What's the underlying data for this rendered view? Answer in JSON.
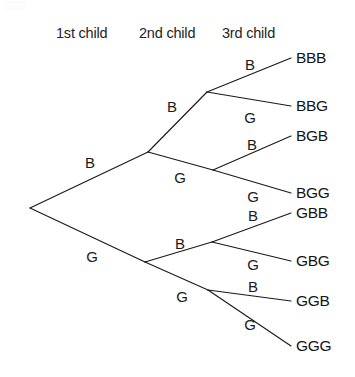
{
  "figure": {
    "background_color": "#ffffff",
    "line_color": "#1a1a1a",
    "text_color": "#1a1a1a"
  },
  "headers": [
    {
      "label": "1st child",
      "x": 56,
      "y": 38
    },
    {
      "label": "2nd child",
      "x": 139,
      "y": 38
    },
    {
      "label": "3rd child",
      "x": 222,
      "y": 38
    }
  ],
  "chart_data": {
    "type": "diagram",
    "subtype": "probability-tree",
    "stages": [
      "1st child",
      "2nd child",
      "3rd child"
    ],
    "symbols": [
      "B",
      "G"
    ],
    "symbol_meanings": {
      "B": "Boy",
      "G": "Girl"
    },
    "branch_count_per_node": 2,
    "total_outcomes": 8,
    "outcomes": [
      "BBB",
      "BBG",
      "BGB",
      "BGG",
      "GBB",
      "GBG",
      "GGB",
      "GGG"
    ],
    "nodes": [
      {
        "id": "root",
        "path": "",
        "x": 30,
        "y": 208
      },
      {
        "id": "B",
        "path": "B",
        "x": 148,
        "y": 152
      },
      {
        "id": "G",
        "path": "G",
        "x": 145,
        "y": 262
      },
      {
        "id": "BB",
        "path": "BB",
        "x": 207,
        "y": 92
      },
      {
        "id": "BG",
        "path": "BG",
        "x": 213,
        "y": 170
      },
      {
        "id": "GB",
        "path": "GB",
        "x": 212,
        "y": 242
      },
      {
        "id": "GG",
        "path": "GG",
        "x": 208,
        "y": 290
      }
    ],
    "edges": [
      {
        "from": "root",
        "to": "B",
        "label": "B",
        "stage": 1,
        "x1": 30,
        "y1": 208,
        "x2": 148,
        "y2": 152,
        "lx": 90,
        "ly": 168
      },
      {
        "from": "root",
        "to": "G",
        "label": "G",
        "stage": 1,
        "x1": 30,
        "y1": 208,
        "x2": 145,
        "y2": 262,
        "lx": 92,
        "ly": 262
      },
      {
        "from": "B",
        "to": "BB",
        "label": "B",
        "stage": 2,
        "x1": 148,
        "y1": 152,
        "x2": 207,
        "y2": 92,
        "lx": 172,
        "ly": 112
      },
      {
        "from": "B",
        "to": "BG",
        "label": "G",
        "stage": 2,
        "x1": 148,
        "y1": 152,
        "x2": 213,
        "y2": 170,
        "lx": 180,
        "ly": 183
      },
      {
        "from": "G",
        "to": "GB",
        "label": "B",
        "stage": 2,
        "x1": 145,
        "y1": 262,
        "x2": 212,
        "y2": 242,
        "lx": 180,
        "ly": 249
      },
      {
        "from": "G",
        "to": "GG",
        "label": "G",
        "stage": 2,
        "x1": 145,
        "y1": 262,
        "x2": 208,
        "y2": 290,
        "lx": 182,
        "ly": 302
      },
      {
        "from": "BB",
        "to": "BBB",
        "label": "B",
        "stage": 3,
        "x1": 207,
        "y1": 92,
        "x2": 291,
        "y2": 58,
        "lx": 250,
        "ly": 70
      },
      {
        "from": "BB",
        "to": "BBG",
        "label": "G",
        "stage": 3,
        "x1": 207,
        "y1": 92,
        "x2": 291,
        "y2": 106,
        "lx": 250,
        "ly": 123
      },
      {
        "from": "BG",
        "to": "BGB",
        "label": "B",
        "stage": 3,
        "x1": 213,
        "y1": 170,
        "x2": 291,
        "y2": 136,
        "lx": 252,
        "ly": 150
      },
      {
        "from": "BG",
        "to": "BGG",
        "label": "G",
        "stage": 3,
        "x1": 213,
        "y1": 170,
        "x2": 291,
        "y2": 193,
        "lx": 253,
        "ly": 202
      },
      {
        "from": "GB",
        "to": "GBB",
        "label": "B",
        "stage": 3,
        "x1": 212,
        "y1": 242,
        "x2": 291,
        "y2": 213,
        "lx": 253,
        "ly": 221
      },
      {
        "from": "GB",
        "to": "GBG",
        "label": "G",
        "stage": 3,
        "x1": 212,
        "y1": 242,
        "x2": 291,
        "y2": 261,
        "lx": 253,
        "ly": 270
      },
      {
        "from": "GG",
        "to": "GGB",
        "label": "B",
        "stage": 3,
        "x1": 208,
        "y1": 290,
        "x2": 291,
        "y2": 301,
        "lx": 253,
        "ly": 292
      },
      {
        "from": "GG",
        "to": "GGG",
        "label": "G",
        "stage": 3,
        "x1": 208,
        "y1": 290,
        "x2": 291,
        "y2": 346,
        "lx": 250,
        "ly": 330
      }
    ],
    "outcome_labels": [
      {
        "text": "BBB",
        "x": 296,
        "y": 63
      },
      {
        "text": "BBG",
        "x": 296,
        "y": 111
      },
      {
        "text": "BGB",
        "x": 296,
        "y": 141
      },
      {
        "text": "BGG",
        "x": 296,
        "y": 198
      },
      {
        "text": "GBB",
        "x": 296,
        "y": 218
      },
      {
        "text": "GBG",
        "x": 296,
        "y": 266
      },
      {
        "text": "GGB",
        "x": 296,
        "y": 306
      },
      {
        "text": "GGG",
        "x": 296,
        "y": 351
      }
    ]
  }
}
